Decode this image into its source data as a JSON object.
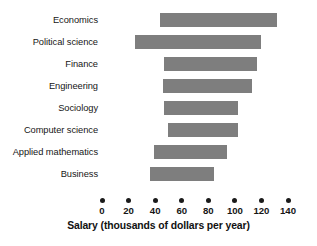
{
  "chart_data": {
    "type": "bar",
    "orientation": "horizontal",
    "bar_style": "floating-range",
    "title": "",
    "subtitle": "",
    "xlabel": "Salary (thousands of dollars per year)",
    "ylabel": "",
    "xlim": [
      0,
      140
    ],
    "xticks": [
      0,
      20,
      40,
      60,
      80,
      100,
      120,
      140
    ],
    "xtick_labels": [
      "0",
      "20",
      "40",
      "60",
      "80",
      "100",
      "120",
      "140"
    ],
    "grid": false,
    "legend": null,
    "bar_color": "#7e7e7e",
    "categories": [
      "Economics",
      "Political science",
      "Finance",
      "Engineering",
      "Sociology",
      "Computer science",
      "Applied mathematics",
      "Business"
    ],
    "series": [
      {
        "name": "Salary range",
        "low": [
          44,
          25,
          47,
          46,
          47,
          50,
          39,
          36
        ],
        "high": [
          132,
          120,
          117,
          113,
          102,
          102,
          94,
          84
        ]
      }
    ],
    "bars": [
      {
        "category": "Economics",
        "low": 44,
        "high": 132
      },
      {
        "category": "Political science",
        "low": 25,
        "high": 120
      },
      {
        "category": "Finance",
        "low": 47,
        "high": 117
      },
      {
        "category": "Engineering",
        "low": 46,
        "high": 113
      },
      {
        "category": "Sociology",
        "low": 47,
        "high": 102
      },
      {
        "category": "Computer science",
        "low": 50,
        "high": 102
      },
      {
        "category": "Applied mathematics",
        "low": 39,
        "high": 94
      },
      {
        "category": "Business",
        "low": 36,
        "high": 84
      }
    ]
  }
}
